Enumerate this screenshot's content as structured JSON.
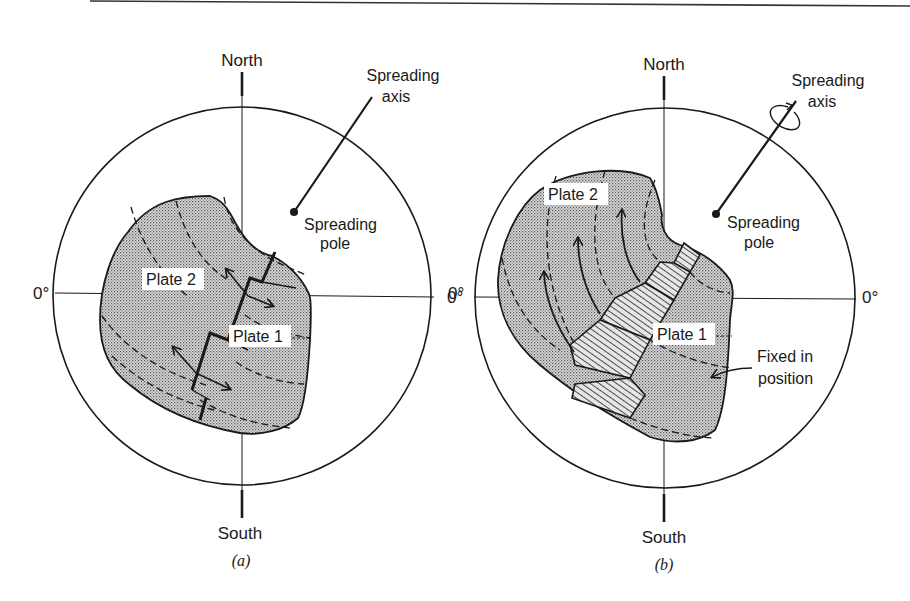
{
  "figure": {
    "panels": [
      {
        "id": "a",
        "caption": "(a)",
        "north_label": "North",
        "south_label": "South",
        "left_meridian_label": "0°",
        "right_meridian_label": "0°",
        "axis_label_line1": "Spreading",
        "axis_label_line2": "axis",
        "pole_label_line1": "Spreading",
        "pole_label_line2": "pole",
        "plate_labels": [
          "Plate 2",
          "Plate 1"
        ]
      },
      {
        "id": "b",
        "caption": "(b)",
        "north_label": "North",
        "south_label": "South",
        "left_meridian_label": "0°",
        "right_meridian_label": "0°",
        "axis_label_line1": "Spreading",
        "axis_label_line2": "axis",
        "pole_label_line1": "Spreading",
        "pole_label_line2": "pole",
        "plate_labels": [
          "Plate 2",
          "Plate 1"
        ],
        "fixed_label_line1": "Fixed in",
        "fixed_label_line2": "position"
      }
    ],
    "colors": {
      "ink": "#1a1a1a",
      "plate_fill": "#c9c9c9",
      "background": "#ffffff"
    }
  }
}
